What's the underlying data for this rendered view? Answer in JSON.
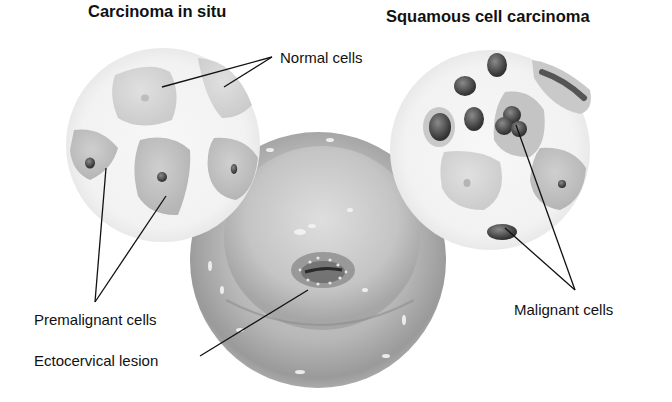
{
  "titles": {
    "left": "Carcinoma in situ",
    "right": "Squamous cell carcinoma"
  },
  "labels": {
    "normal_cells": "Normal cells",
    "premalignant_cells": "Premalignant cells",
    "ectocervical_lesion": "Ectocervical lesion",
    "malignant_cells": "Malignant cells"
  }
}
